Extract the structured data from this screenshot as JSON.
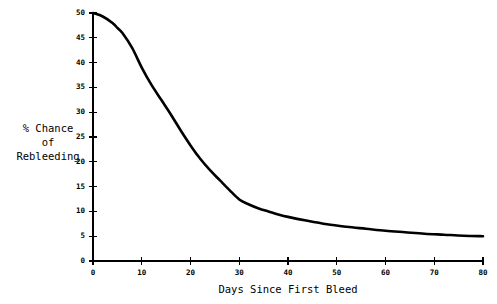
{
  "chart_data": {
    "type": "line",
    "title": "",
    "xlabel": "Days Since First Bleed",
    "ylabel": "% Chance of Rebleeding",
    "ylabel_lines": [
      "% Chance",
      "of",
      "Rebleeding"
    ],
    "xlim": [
      0,
      80
    ],
    "ylim": [
      0,
      50
    ],
    "xticks": [
      0,
      10,
      20,
      30,
      40,
      50,
      60,
      70,
      80
    ],
    "xtick_labels": [
      "0",
      "10",
      "20",
      "30",
      "40",
      "50",
      "60",
      "70",
      "80"
    ],
    "yticks": [
      0,
      5,
      10,
      15,
      20,
      25,
      30,
      35,
      40,
      45,
      50
    ],
    "ytick_labels": [
      "0",
      "5",
      "10",
      "15",
      "20",
      "25",
      "30",
      "35",
      "40",
      "45",
      "50"
    ],
    "grid": false,
    "legend": false,
    "line_color": "#000000",
    "background_color": "#ffffff",
    "series": [
      {
        "name": "% Chance of Rebleeding",
        "x": [
          0,
          2,
          4,
          5,
          6,
          8,
          10,
          12,
          14,
          16,
          18,
          20,
          22,
          24,
          26,
          28,
          30,
          32,
          34,
          36,
          38,
          40,
          44,
          48,
          52,
          56,
          60,
          64,
          68,
          72,
          76,
          80
        ],
        "values": [
          50.0,
          49.3,
          48.0,
          47.0,
          46.0,
          43.0,
          39.0,
          35.5,
          32.5,
          29.5,
          26.3,
          23.3,
          20.6,
          18.3,
          16.3,
          14.3,
          12.4,
          11.4,
          10.6,
          10.0,
          9.4,
          8.9,
          8.1,
          7.4,
          6.9,
          6.5,
          6.1,
          5.8,
          5.5,
          5.3,
          5.1,
          5.0
        ]
      }
    ]
  },
  "axes": {
    "x_axis_name": "x-axis",
    "y_axis_name": "y-axis"
  }
}
